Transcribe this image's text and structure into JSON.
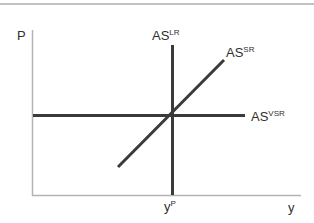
{
  "figure": {
    "axes": {
      "price_axis_label": "P",
      "output_axis_label": "y",
      "potential_output_tick": {
        "base": "y",
        "sup": "P"
      }
    },
    "curves": {
      "as_lr": {
        "base": "AS",
        "sup": "LR"
      },
      "as_sr": {
        "base": "AS",
        "sup": "SR"
      },
      "as_vsr": {
        "base": "AS",
        "sup": "VSR"
      }
    },
    "colors": {
      "curve": "#3a3a3a",
      "axis": "#b3b3b3",
      "top_rule": "#c2c2c2",
      "background": "#ffffff"
    }
  }
}
